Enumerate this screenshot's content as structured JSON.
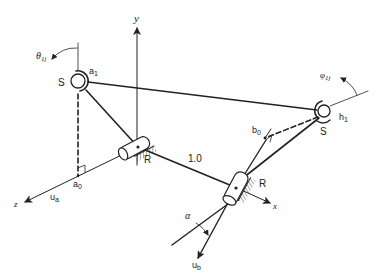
{
  "diagram": {
    "type": "spatial RSSR linkage schematic",
    "axes": {
      "x": {
        "label": "x"
      },
      "y": {
        "label": "y"
      },
      "z": {
        "label": "z"
      }
    },
    "joints": {
      "spherical_left": {
        "label": "S",
        "point_label": "a",
        "point_sub": "1"
      },
      "spherical_right": {
        "label": "S",
        "point_label": "h",
        "point_sub": "1"
      },
      "revolute_left": {
        "label": "R"
      },
      "revolute_right": {
        "label": "R"
      }
    },
    "points": {
      "a0": {
        "label": "a",
        "sub": "0"
      },
      "b0": {
        "label": "b",
        "sub": "0"
      }
    },
    "vectors": {
      "ua": {
        "label": "u",
        "sub": "a"
      },
      "ub": {
        "label": "u",
        "sub": "b"
      }
    },
    "angles": {
      "theta": {
        "label": "θ",
        "sub": "1j"
      },
      "phi": {
        "label": "φ",
        "sub": "1j"
      },
      "alpha": {
        "label": "α"
      }
    },
    "dimension": {
      "ground_link": "1.0"
    }
  }
}
